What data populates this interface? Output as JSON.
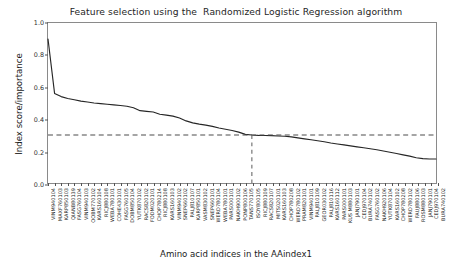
{
  "chart_data": {
    "type": "line",
    "title": "Feature selection using the  Randomized Logistic Regression algorithm",
    "xlabel": "Amino acid indices in the AAindex1",
    "ylabel": "Index score/importance",
    "ylim": [
      0.0,
      1.0
    ],
    "yticks": [
      0.0,
      0.2,
      0.4,
      0.6,
      0.8,
      1.0
    ],
    "ytick_labels": [
      "0.0",
      "0.2",
      "0.4",
      "0.6",
      "0.8",
      "1.0"
    ],
    "grid": false,
    "legend": null,
    "line_color": "#262626",
    "threshold_color": "#4d4d4d",
    "horizontal_threshold": 0.3,
    "vertical_threshold_index": 31,
    "categories": [
      "VINM940104",
      "MAXF760103",
      "KARP850103",
      "QIANB80139",
      "FASG760104",
      "VINM940103",
      "OOBM770102",
      "KARS160104",
      "RICJ880108",
      "WEBA780101",
      "COHE430101",
      "FASG760105",
      "DOBM850104",
      "YUTK870102",
      "RACS820102",
      "FODM020101",
      "CHOP780214",
      "RICJ880108",
      "KARS160103",
      "VINM940102",
      "SNEP660102",
      "PALJ810107",
      "KARP850101",
      "VASM830102",
      "SNEP660101",
      "WERD780104",
      "WEBA780101",
      "PARS000101",
      "NAKH900102",
      "PONP800106",
      "TANS770105",
      "ISOY800105",
      "RICJ880109",
      "RACS820107",
      "MITS020101",
      "KARS160103",
      "CHOP780208",
      "WERD780102",
      "PRAM820101",
      "VINM940101",
      "PALJ810109",
      "GEOR030102",
      "PALJ810116",
      "KARS160112",
      "PARS000101",
      "KUS M880103",
      "JANJ790101",
      "CEDJ970104",
      "BURA740102",
      "FASG760102",
      "NAKH920106",
      "YUTK870104",
      "KARS160102",
      "CHOP780208",
      "WERD780102",
      "FAUJ880106",
      "ROSM880103",
      "JANJ790101",
      "CEDJ970104",
      "BURA740102"
    ],
    "values": [
      0.9,
      0.56,
      0.54,
      0.528,
      0.52,
      0.512,
      0.506,
      0.5,
      0.496,
      0.492,
      0.488,
      0.484,
      0.48,
      0.47,
      0.452,
      0.448,
      0.444,
      0.43,
      0.424,
      0.418,
      0.406,
      0.388,
      0.376,
      0.368,
      0.362,
      0.354,
      0.344,
      0.336,
      0.328,
      0.318,
      0.304,
      0.3,
      0.298,
      0.297,
      0.296,
      0.294,
      0.292,
      0.288,
      0.282,
      0.276,
      0.27,
      0.264,
      0.258,
      0.25,
      0.244,
      0.238,
      0.232,
      0.226,
      0.22,
      0.214,
      0.208,
      0.2,
      0.192,
      0.184,
      0.176,
      0.168,
      0.158,
      0.152,
      0.15,
      0.15
    ]
  }
}
